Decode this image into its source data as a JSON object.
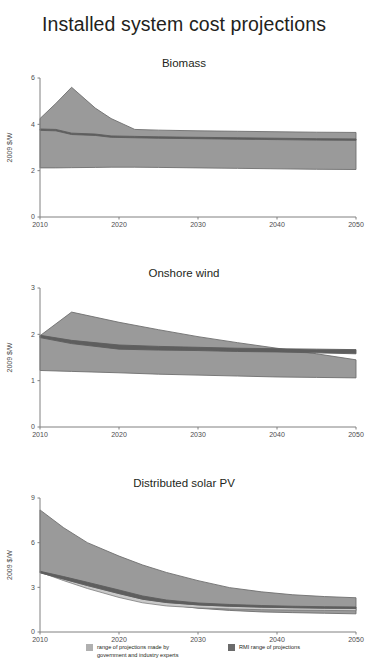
{
  "title": "Installed system cost projections",
  "colors": {
    "expert_band": "#9a9a9a",
    "expert_band_edge": "#6f6f6f",
    "rmi_band": "#c9c9c9",
    "rmi_line": "#5e5e5e",
    "axis": "#808080",
    "text": "#231f20"
  },
  "legend": {
    "items": [
      {
        "label": "range of projections made by\ngovernment and industry experts",
        "swatch_name": "expert-range-swatch",
        "color": "#b0b0b0"
      },
      {
        "label": "RMI range of projections",
        "swatch_name": "rmi-range-swatch",
        "color": "#6b6b6b"
      }
    ]
  },
  "chart_data": [
    {
      "type": "area",
      "title": "Biomass",
      "subtitle": "Biomass",
      "xlabel": "",
      "ylabel": "2009 $/W",
      "xlim": [
        2010,
        2050
      ],
      "ylim": [
        0,
        6
      ],
      "xticks": [
        2010,
        2020,
        2030,
        2040,
        2050
      ],
      "yticks": [
        0,
        2,
        4,
        6
      ],
      "grid": false,
      "x": [
        2010,
        2012,
        2014,
        2017,
        2019,
        2022,
        2025,
        2030,
        2035,
        2040,
        2045,
        2050
      ],
      "series": [
        {
          "name": "range of projections made by government and industry experts (upper)",
          "values": [
            4.25,
            4.9,
            5.6,
            4.7,
            4.25,
            3.78,
            3.75,
            3.72,
            3.7,
            3.68,
            3.66,
            3.65
          ]
        },
        {
          "name": "range of projections made by government and industry experts (lower)",
          "values": [
            2.12,
            2.12,
            2.13,
            2.14,
            2.15,
            2.15,
            2.14,
            2.12,
            2.1,
            2.08,
            2.06,
            2.05
          ]
        },
        {
          "name": "RMI range of projections (upper)",
          "values": [
            3.8,
            3.78,
            3.62,
            3.58,
            3.5,
            3.48,
            3.46,
            3.44,
            3.42,
            3.4,
            3.38,
            3.37
          ]
        },
        {
          "name": "RMI range of projections (lower)",
          "values": [
            3.74,
            3.72,
            3.56,
            3.52,
            3.44,
            3.42,
            3.4,
            3.38,
            3.36,
            3.34,
            3.32,
            3.31
          ]
        }
      ]
    },
    {
      "type": "area",
      "title": "Onshore wind",
      "subtitle": "Onshore wind",
      "xlabel": "",
      "ylabel": "2009 $/W",
      "xlim": [
        2010,
        2050
      ],
      "ylim": [
        0,
        3
      ],
      "xticks": [
        2010,
        2020,
        2030,
        2040,
        2050
      ],
      "yticks": [
        0,
        1,
        2,
        3
      ],
      "grid": false,
      "x": [
        2010,
        2014,
        2020,
        2025,
        2030,
        2035,
        2040,
        2045,
        2050
      ],
      "series": [
        {
          "name": "range of projections made by government and industry experts (upper)",
          "values": [
            1.97,
            2.48,
            2.26,
            2.1,
            1.95,
            1.82,
            1.7,
            1.58,
            1.45
          ]
        },
        {
          "name": "range of projections made by government and industry experts (lower)",
          "values": [
            1.22,
            1.2,
            1.17,
            1.14,
            1.12,
            1.1,
            1.08,
            1.07,
            1.06
          ]
        },
        {
          "name": "RMI range of projections (upper)",
          "values": [
            1.98,
            1.87,
            1.77,
            1.74,
            1.72,
            1.7,
            1.69,
            1.68,
            1.67
          ]
        },
        {
          "name": "RMI range of projections (lower)",
          "values": [
            1.93,
            1.8,
            1.68,
            1.66,
            1.65,
            1.63,
            1.62,
            1.6,
            1.58
          ]
        }
      ]
    },
    {
      "type": "area",
      "title": "Distributed solar PV",
      "subtitle": "Distributed solar PV",
      "xlabel": "",
      "ylabel": "2009 $/W",
      "xlim": [
        2010,
        2050
      ],
      "ylim": [
        0,
        9
      ],
      "xticks": [
        2010,
        2020,
        2030,
        2040,
        2050
      ],
      "yticks": [
        0,
        3,
        6,
        9
      ],
      "grid": false,
      "x": [
        2010,
        2013,
        2016,
        2020,
        2023,
        2026,
        2030,
        2034,
        2038,
        2042,
        2046,
        2050
      ],
      "series": [
        {
          "name": "range of projections made by government and industry experts (upper)",
          "values": [
            8.2,
            7.0,
            6.0,
            5.1,
            4.5,
            4.0,
            3.45,
            2.98,
            2.7,
            2.5,
            2.38,
            2.3
          ]
        },
        {
          "name": "range of projections made by government and industry experts (lower)",
          "values": [
            4.05,
            3.6,
            3.2,
            2.6,
            2.15,
            1.85,
            1.6,
            1.45,
            1.35,
            1.3,
            1.26,
            1.22
          ]
        },
        {
          "name": "RMI range of projections (upper)",
          "values": [
            4.08,
            3.72,
            3.34,
            2.82,
            2.42,
            2.15,
            1.95,
            1.85,
            1.78,
            1.73,
            1.7,
            1.68
          ]
        },
        {
          "name": "RMI range of projections (lower)",
          "values": [
            3.98,
            3.55,
            3.12,
            2.58,
            2.2,
            1.98,
            1.82,
            1.73,
            1.67,
            1.63,
            1.6,
            1.58
          ]
        },
        {
          "name": "RMI inner light band (lower)",
          "values": [
            4.02,
            3.45,
            2.92,
            2.32,
            1.96,
            1.75,
            1.62,
            1.55,
            1.5,
            1.47,
            1.45,
            1.43
          ]
        }
      ]
    }
  ]
}
